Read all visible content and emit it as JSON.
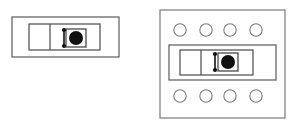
{
  "diagram": {
    "type": "technical-line-art",
    "background_color": "#ffffff",
    "stroke_color": "#4a4a4a",
    "fill_color": "#111111",
    "figure_count": 2,
    "figures": [
      {
        "id": "left-figure",
        "label": "standalone-module",
        "frame": null,
        "module": {
          "outer_rect": {
            "x": 12,
            "y": 17,
            "width": 107,
            "height": 40
          },
          "inner_rect": {
            "x": 29,
            "y": 24,
            "width": 71,
            "height": 26
          },
          "divider_x": 50,
          "left_cell_empty": true,
          "core": {
            "square": {
              "x": 66,
              "y": 29,
              "width": 20,
              "height": 18
            },
            "disc": {
              "cx": 76,
              "cy": 38,
              "r": 7
            },
            "nodes": [
              {
                "cx": 64,
                "cy": 30,
                "r": 2.1
              },
              {
                "cx": 64,
                "cy": 46,
                "r": 2.1
              }
            ],
            "link": {
              "x1": 64,
              "y1": 30,
              "x2": 64,
              "y2": 46
            }
          }
        },
        "port_circles": []
      },
      {
        "id": "right-figure",
        "label": "module-in-frame-with-ports",
        "frame": {
          "x": 160,
          "y": 10,
          "width": 125,
          "height": 108
        },
        "module": {
          "outer_rect": {
            "x": 169,
            "y": 45,
            "width": 107,
            "height": 35
          },
          "inner_rect": {
            "x": 180,
            "y": 50,
            "width": 73,
            "height": 25
          },
          "divider_x": 201,
          "left_cell_empty": true,
          "core": {
            "square": {
              "x": 218,
              "y": 53,
              "width": 20,
              "height": 18
            },
            "disc": {
              "cx": 228,
              "cy": 62,
              "r": 7
            },
            "nodes": [
              {
                "cx": 215,
                "cy": 54,
                "r": 2.1
              },
              {
                "cx": 215,
                "cy": 70,
                "r": 2.1
              }
            ],
            "link": {
              "x1": 215,
              "y1": 54,
              "x2": 215,
              "y2": 70
            }
          }
        },
        "port_circles": [
          {
            "cx": 180,
            "cy": 30,
            "r": 6.2,
            "row": "top"
          },
          {
            "cx": 206,
            "cy": 30,
            "r": 6.2,
            "row": "top"
          },
          {
            "cx": 230,
            "cy": 30,
            "r": 6.2,
            "row": "top"
          },
          {
            "cx": 256,
            "cy": 30,
            "r": 6.2,
            "row": "top"
          },
          {
            "cx": 180,
            "cy": 96,
            "r": 6.2,
            "row": "bottom"
          },
          {
            "cx": 206,
            "cy": 96,
            "r": 6.2,
            "row": "bottom"
          },
          {
            "cx": 230,
            "cy": 96,
            "r": 6.2,
            "row": "bottom"
          },
          {
            "cx": 256,
            "cy": 96,
            "r": 6.2,
            "row": "bottom"
          }
        ]
      }
    ]
  }
}
